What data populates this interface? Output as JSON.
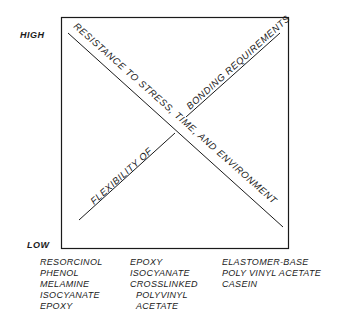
{
  "axis": {
    "high_label": "HIGH",
    "low_label": "LOW"
  },
  "lines": {
    "descending": "RESISTANCE TO STRESS, TIME, AND ENVIRONMENT",
    "ascending_lower": "FLEXIBILITY OF",
    "ascending_upper": "BONDING REQUIREMENTS"
  },
  "columns": [
    {
      "items": [
        "RESORCINOL",
        "PHENOL",
        "MELAMINE",
        "ISOCYANATE",
        "EPOXY"
      ]
    },
    {
      "items": [
        "EPOXY",
        "ISOCYANATE",
        "CROSSLINKED",
        "POLYVINYL",
        "ACETATE"
      ]
    },
    {
      "items": [
        "ELASTOMER-BASE",
        "POLY VINYL ACETATE",
        "CASEIN"
      ]
    }
  ],
  "colors": {
    "ink": "#1a1a1a",
    "background": "#ffffff"
  }
}
